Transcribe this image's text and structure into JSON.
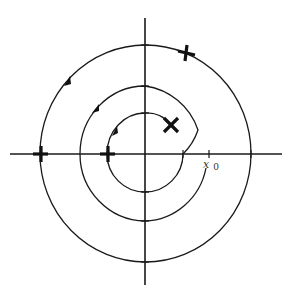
{
  "diagram": {
    "type": "phase-portrait",
    "center": [
      145,
      154
    ],
    "axes": {
      "horizontal": {
        "x1": 10,
        "x2": 282,
        "y": 154
      },
      "vertical": {
        "x": 145,
        "y1": 18,
        "y2": 285
      }
    },
    "labels": {
      "start_point": "x",
      "start_point_subscript": "0"
    },
    "colors": {
      "stroke": "#1a1a1a",
      "background": "#ffffff"
    },
    "markers": [
      {
        "kind": "plus",
        "x": 186,
        "y": 52
      },
      {
        "kind": "plus",
        "x": 40,
        "y": 154
      },
      {
        "kind": "plus",
        "x": 107,
        "y": 154
      },
      {
        "kind": "cross",
        "x": 171,
        "y": 125
      }
    ],
    "arrows": [
      {
        "x": 69,
        "y": 80,
        "angle": -55
      },
      {
        "x": 97,
        "y": 108,
        "angle": -55
      },
      {
        "x": 116,
        "y": 130,
        "angle": -65
      }
    ]
  }
}
